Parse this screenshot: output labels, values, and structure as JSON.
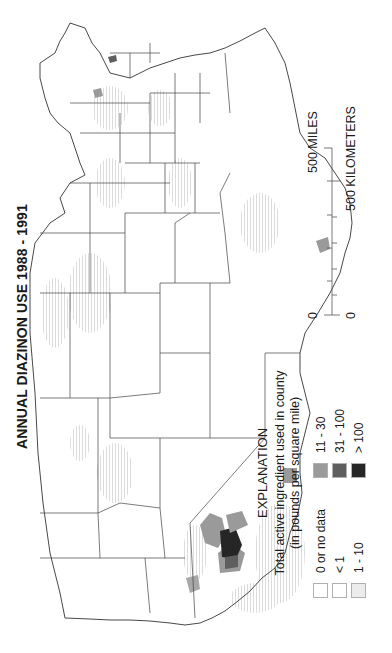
{
  "title": "ANNUAL DIAZINON USE 1988 - 1991",
  "legend": {
    "heading": "EXPLANATION",
    "description_line1": "Total active ingredient used in county",
    "description_line2": "(in pounds per square mile)",
    "items": [
      {
        "label": "0 or no data",
        "color": "#ffffff"
      },
      {
        "label": "< 1",
        "color": "#ffffff"
      },
      {
        "label": "1 - 10",
        "color": "#ececec"
      },
      {
        "label": "11 - 30",
        "color": "#9a9a9a"
      },
      {
        "label": "31 - 100",
        "color": "#5e5e5e"
      },
      {
        "label": "> 100",
        "color": "#262626"
      }
    ]
  },
  "scale": {
    "miles_label": "500 MILES",
    "km_label": "500 KILOMETERS",
    "zero_miles": "0",
    "zero_km": "0"
  },
  "map": {
    "orientation": "rotated 90 degrees counter-clockwise",
    "region": "Conterminous United States, county-level shading",
    "hotspots": [
      {
        "area": "California Central Valley",
        "category": "> 100"
      },
      {
        "area": "California Central Valley",
        "category": "31 - 100"
      },
      {
        "area": "California Central Valley",
        "category": "11 - 30"
      },
      {
        "area": "Southern California",
        "category": "11 - 30"
      },
      {
        "area": "Washington",
        "category": "11 - 30"
      },
      {
        "area": "Southern Texas",
        "category": "11 - 30"
      },
      {
        "area": "Southern Florida",
        "category": "11 - 30"
      }
    ]
  }
}
